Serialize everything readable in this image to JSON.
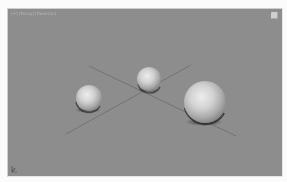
{
  "viewport": {
    "label": "[+] [Persp] [Realistic]",
    "background_color": "#8d8d8d",
    "viewcube_icon": "viewcube-icon",
    "axis_icon": "axis-tripod-icon"
  },
  "scene": {
    "grid_lines": [
      {
        "name": "grid-line-a",
        "x1": 81,
        "y1": 57,
        "x2": 228,
        "y2": 127
      },
      {
        "name": "grid-line-b",
        "x1": 58,
        "y1": 125,
        "x2": 183,
        "y2": 56
      }
    ],
    "objects": [
      {
        "name": "sphere-left",
        "cx": 81,
        "cy": 89,
        "r": 13
      },
      {
        "name": "sphere-middle",
        "cx": 141,
        "cy": 70,
        "r": 12
      },
      {
        "name": "sphere-right",
        "cx": 197,
        "cy": 93,
        "r": 21
      }
    ]
  }
}
